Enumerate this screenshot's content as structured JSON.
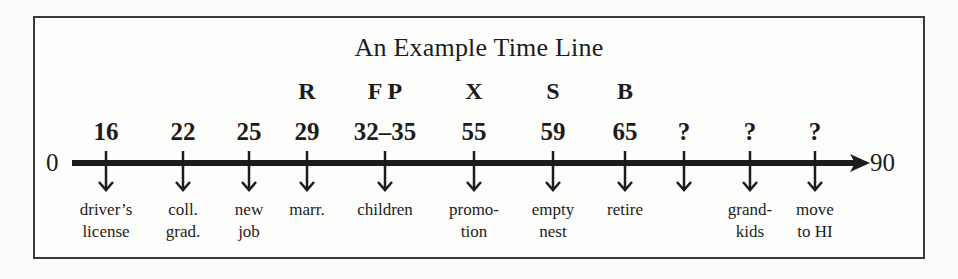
{
  "diagram": {
    "title": "An Example Time Line",
    "axis": {
      "start_label": "0",
      "end_label": "90",
      "start": 0,
      "end": 90
    },
    "events": [
      {
        "age": "16",
        "code": "",
        "label_lines": [
          "driver’s",
          "license"
        ],
        "x": 106
      },
      {
        "age": "22",
        "code": "",
        "label_lines": [
          "coll.",
          "grad."
        ],
        "x": 183
      },
      {
        "age": "25",
        "code": "",
        "label_lines": [
          "new",
          "job"
        ],
        "x": 249
      },
      {
        "age": "29",
        "code": "R",
        "label_lines": [
          "marr.",
          ""
        ],
        "x": 307
      },
      {
        "age": "32–35",
        "code": "F P",
        "label_lines": [
          "children",
          ""
        ],
        "x": 385
      },
      {
        "age": "55",
        "code": "X",
        "label_lines": [
          "promo-",
          "tion"
        ],
        "x": 474
      },
      {
        "age": "59",
        "code": "S",
        "label_lines": [
          "empty",
          "nest"
        ],
        "x": 553
      },
      {
        "age": "65",
        "code": "B",
        "label_lines": [
          "retire",
          ""
        ],
        "x": 625
      },
      {
        "age": "?",
        "code": "",
        "label_lines": [
          "",
          ""
        ],
        "x": 684
      },
      {
        "age": "?",
        "code": "",
        "label_lines": [
          "grand-",
          "kids"
        ],
        "x": 750
      },
      {
        "age": "?",
        "code": "",
        "label_lines": [
          "move",
          "to HI"
        ],
        "x": 815
      }
    ]
  },
  "colors": {
    "ink": "#1c1c1c",
    "frame": "#3a3a3a",
    "background": "#fbfbfa"
  }
}
